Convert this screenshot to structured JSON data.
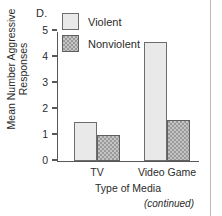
{
  "figure": {
    "panel_label": "D.",
    "continued_note": "(continued)"
  },
  "chart_data": {
    "type": "bar",
    "title": "",
    "xlabel": "Type of Media",
    "ylabel": "Mean Number Aggressive Responses",
    "ylabel_line1": "Mean Number Aggressive",
    "ylabel_line2": "Responses",
    "categories": [
      "TV",
      "Video Game"
    ],
    "series": [
      {
        "name": "Violent",
        "color": "#e9e9e9",
        "values": [
          1.5,
          4.55
        ]
      },
      {
        "name": "Nonviolent",
        "color": "#9a9a9a",
        "values": [
          1.0,
          1.55
        ]
      }
    ],
    "ylim": [
      0,
      5
    ],
    "yticks": [
      0,
      1,
      2,
      3,
      4,
      5
    ],
    "ytick_labels": [
      "0",
      "1",
      "2",
      "3",
      "4",
      "5"
    ],
    "grid": false,
    "legend_position": "top-left-inside"
  },
  "legend": {
    "items": [
      {
        "label": "Violent"
      },
      {
        "label": "Nonviolent"
      }
    ]
  }
}
